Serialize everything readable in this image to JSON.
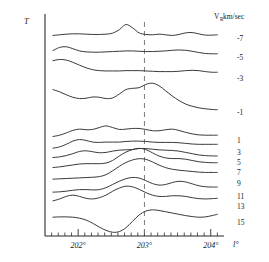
{
  "figure": {
    "y_axis_label": "T",
    "x_axis_label": "l°",
    "legend_header": "V",
    "legend_header_sub": "R",
    "legend_header_unit": " km/sec",
    "marker_line_value": "203°"
  },
  "chart_data": {
    "type": "line",
    "title": "",
    "subtitle": "",
    "xlabel": "l°",
    "ylabel": "T",
    "grid": false,
    "legend_position": "right",
    "legend_title": "V_R km/sec",
    "xlim": [
      201.5,
      204.2
    ],
    "xticks": [
      202,
      203,
      204
    ],
    "xticklabels": [
      "202°",
      "203°",
      "204°"
    ],
    "minor_tick_step": 0.1,
    "annotations": [
      {
        "type": "vline",
        "x": 203,
        "style": "dashed",
        "label": "203°"
      }
    ],
    "note": "Stacked antenna-temperature profiles, one per radial-velocity channel; each trace is offset vertically and labelled at right by its V_R value in km/sec.",
    "series": [
      {
        "name": "-7",
        "label": "-7",
        "baseline_y": 38,
        "x": [
          201.62,
          201.72,
          201.82,
          201.92,
          202.02,
          202.12,
          202.22,
          202.32,
          202.42,
          202.52,
          202.62,
          202.72,
          202.82,
          202.92,
          203.02,
          203.12,
          203.22,
          203.32,
          203.42,
          203.52,
          203.62,
          203.72,
          203.82,
          203.92,
          204.02,
          204.1
        ],
        "values": [
          0.8,
          1.0,
          1.2,
          1.3,
          1.3,
          1.2,
          1.1,
          1.1,
          1.2,
          1.5,
          2.6,
          4.2,
          3.2,
          1.6,
          1.1,
          1.0,
          1.2,
          1.0,
          0.8,
          1.1,
          1.6,
          1.7,
          1.3,
          0.9,
          0.9,
          1.0
        ]
      },
      {
        "name": "-5",
        "label": "-5",
        "baseline_y": 57,
        "x": [
          201.62,
          201.72,
          201.82,
          201.92,
          202.02,
          202.12,
          202.22,
          202.32,
          202.42,
          202.52,
          202.62,
          202.72,
          202.82,
          202.92,
          203.02,
          203.12,
          203.22,
          203.32,
          203.42,
          203.52,
          203.62,
          203.72,
          203.82,
          203.92,
          204.02,
          204.1
        ],
        "values": [
          2.0,
          3.0,
          3.2,
          2.6,
          1.9,
          1.6,
          1.5,
          1.5,
          1.6,
          1.7,
          1.8,
          1.9,
          1.9,
          1.8,
          1.7,
          1.7,
          1.8,
          1.9,
          2.1,
          2.2,
          2.1,
          1.8,
          1.4,
          1.1,
          1.0,
          1.0
        ]
      },
      {
        "name": "-3",
        "label": "-3",
        "baseline_y": 78,
        "x": [
          201.62,
          201.72,
          201.82,
          201.92,
          202.02,
          202.12,
          202.22,
          202.32,
          202.42,
          202.52,
          202.62,
          202.72,
          202.82,
          202.92,
          203.02,
          203.12,
          203.22,
          203.32,
          203.42,
          203.52,
          203.62,
          203.72,
          203.82,
          203.92,
          204.02,
          204.1
        ],
        "values": [
          5.4,
          5.8,
          5.6,
          4.9,
          4.0,
          3.2,
          2.6,
          2.3,
          2.2,
          2.2,
          2.2,
          2.3,
          2.3,
          2.3,
          2.2,
          2.1,
          2.0,
          2.0,
          2.0,
          2.1,
          2.3,
          2.4,
          2.3,
          2.0,
          1.8,
          1.8
        ]
      },
      {
        "name": "-1",
        "label": "-1",
        "baseline_y": 112,
        "x": [
          201.62,
          201.72,
          201.82,
          201.92,
          202.02,
          202.12,
          202.22,
          202.32,
          202.42,
          202.52,
          202.62,
          202.72,
          202.82,
          202.92,
          203.02,
          203.12,
          203.22,
          203.32,
          203.42,
          203.52,
          203.62,
          203.72,
          203.82,
          203.92,
          204.02,
          204.1
        ],
        "values": [
          7.0,
          6.3,
          5.4,
          4.6,
          4.2,
          4.3,
          4.7,
          4.6,
          4.2,
          4.4,
          5.6,
          7.0,
          7.4,
          7.6,
          8.6,
          9.0,
          8.2,
          6.6,
          5.0,
          3.6,
          2.5,
          1.8,
          1.3,
          1.0,
          0.8,
          0.7
        ]
      },
      {
        "name": "1",
        "label": "1",
        "baseline_y": 140,
        "x": [
          201.62,
          201.72,
          201.82,
          201.92,
          202.02,
          202.12,
          202.22,
          202.32,
          202.42,
          202.52,
          202.62,
          202.72,
          202.82,
          202.92,
          203.02,
          203.12,
          203.22,
          203.32,
          203.42,
          203.52,
          203.62,
          203.72,
          203.82,
          203.92,
          204.02,
          204.1
        ],
        "values": [
          1.1,
          1.5,
          2.2,
          3.0,
          3.4,
          3.2,
          3.3,
          3.9,
          4.4,
          3.9,
          3.3,
          3.4,
          3.6,
          3.6,
          3.3,
          2.9,
          2.9,
          3.2,
          3.4,
          3.0,
          2.4,
          1.9,
          1.6,
          1.5,
          1.5,
          1.5
        ]
      },
      {
        "name": "3",
        "label": "3",
        "baseline_y": 152,
        "x": [
          201.62,
          201.72,
          201.82,
          201.92,
          202.02,
          202.12,
          202.22,
          202.32,
          202.42,
          202.52,
          202.62,
          202.72,
          202.82,
          202.92,
          203.02,
          203.12,
          203.22,
          203.32,
          203.42,
          203.52,
          203.62,
          203.72,
          203.82,
          203.92,
          204.02,
          204.1
        ],
        "values": [
          1.2,
          1.6,
          2.4,
          3.4,
          3.9,
          3.6,
          3.1,
          3.0,
          3.1,
          3.1,
          3.1,
          3.3,
          3.4,
          3.4,
          3.3,
          3.1,
          3.0,
          3.0,
          3.0,
          2.9,
          2.7,
          2.5,
          2.4,
          2.4,
          2.4,
          2.4
        ]
      },
      {
        "name": "5",
        "label": "5",
        "baseline_y": 162,
        "x": [
          201.62,
          201.72,
          201.82,
          201.92,
          202.02,
          202.12,
          202.22,
          202.32,
          202.42,
          202.52,
          202.62,
          202.72,
          202.82,
          202.92,
          203.02,
          203.12,
          203.22,
          203.32,
          203.42,
          203.52,
          203.62,
          203.72,
          203.82,
          203.92,
          204.02,
          204.1
        ],
        "values": [
          1.4,
          1.6,
          2.0,
          2.6,
          3.3,
          3.5,
          3.2,
          2.9,
          3.0,
          3.4,
          3.7,
          3.8,
          3.9,
          4.2,
          4.2,
          4.0,
          3.8,
          3.7,
          3.6,
          3.4,
          3.0,
          2.6,
          2.2,
          2.0,
          1.9,
          1.9
        ]
      },
      {
        "name": "7",
        "label": "7",
        "baseline_y": 172,
        "x": [
          201.62,
          201.72,
          201.82,
          201.92,
          202.02,
          202.12,
          202.22,
          202.32,
          202.42,
          202.52,
          202.62,
          202.72,
          202.82,
          202.92,
          203.02,
          203.12,
          203.22,
          203.32,
          203.42,
          203.52,
          203.62,
          203.72,
          203.82,
          203.92,
          204.02,
          204.1
        ],
        "values": [
          1.4,
          1.6,
          1.9,
          2.2,
          2.5,
          2.6,
          2.6,
          2.6,
          2.8,
          3.6,
          5.0,
          6.2,
          7.0,
          7.4,
          7.0,
          6.0,
          5.0,
          4.4,
          4.2,
          4.2,
          4.0,
          3.6,
          3.2,
          3.0,
          2.9,
          2.9
        ]
      },
      {
        "name": "9",
        "label": "9",
        "baseline_y": 183,
        "x": [
          201.62,
          201.72,
          201.82,
          201.92,
          202.02,
          202.12,
          202.22,
          202.32,
          202.42,
          202.52,
          202.62,
          202.72,
          202.82,
          202.92,
          203.02,
          203.12,
          203.22,
          203.32,
          203.42,
          203.52,
          203.62,
          203.72,
          203.82,
          203.92,
          204.02,
          204.1
        ],
        "values": [
          1.2,
          1.3,
          1.4,
          1.5,
          1.6,
          1.7,
          1.8,
          2.0,
          2.6,
          3.8,
          5.2,
          6.4,
          7.2,
          7.6,
          7.4,
          6.6,
          5.6,
          4.8,
          4.3,
          4.0,
          3.8,
          3.6,
          3.4,
          3.3,
          3.3,
          3.3
        ]
      },
      {
        "name": "11",
        "label": "11",
        "baseline_y": 196,
        "x": [
          201.62,
          201.72,
          201.82,
          201.92,
          202.02,
          202.12,
          202.22,
          202.32,
          202.42,
          202.52,
          202.62,
          202.72,
          202.82,
          202.92,
          203.02,
          203.12,
          203.22,
          203.32,
          203.42,
          203.52,
          203.62,
          203.72,
          203.82,
          203.92,
          204.02,
          204.1
        ],
        "values": [
          1.2,
          1.3,
          1.5,
          1.8,
          2.0,
          2.0,
          1.9,
          2.0,
          2.6,
          3.6,
          4.6,
          5.4,
          5.8,
          5.6,
          4.8,
          3.9,
          3.4,
          3.6,
          4.2,
          4.6,
          4.4,
          3.8,
          3.2,
          2.9,
          2.8,
          2.8
        ]
      },
      {
        "name": "13",
        "label": "13",
        "baseline_y": 206,
        "x": [
          201.62,
          201.72,
          201.82,
          201.92,
          202.02,
          202.12,
          202.22,
          202.32,
          202.42,
          202.52,
          202.62,
          202.72,
          202.82,
          202.92,
          203.02,
          203.12,
          203.22,
          203.32,
          203.42,
          203.52,
          203.62,
          203.72,
          203.82,
          203.92,
          204.02,
          204.1
        ],
        "values": [
          1.6,
          2.2,
          3.0,
          3.4,
          3.0,
          2.4,
          2.2,
          2.6,
          3.4,
          4.6,
          5.6,
          6.2,
          6.0,
          5.2,
          4.2,
          3.4,
          3.0,
          3.0,
          3.2,
          3.2,
          3.0,
          2.6,
          2.3,
          2.2,
          2.3,
          2.4
        ]
      },
      {
        "name": "15",
        "label": "15",
        "baseline_y": 222,
        "x": [
          201.62,
          201.72,
          201.82,
          201.92,
          202.02,
          202.12,
          202.22,
          202.32,
          202.42,
          202.52,
          202.62,
          202.72,
          202.82,
          202.92,
          203.02,
          203.12,
          203.22,
          203.32,
          203.42,
          203.52,
          203.62,
          203.72,
          203.82,
          203.92,
          204.02,
          204.1
        ],
        "values": [
          1.5,
          1.6,
          1.6,
          1.5,
          1.2,
          0.6,
          -0.4,
          -1.6,
          -2.6,
          -3.2,
          -3.0,
          -1.8,
          0.2,
          2.2,
          3.4,
          3.8,
          3.6,
          3.2,
          2.8,
          2.4,
          2.0,
          1.7,
          1.5,
          1.6,
          2.0,
          2.4
        ]
      }
    ]
  },
  "axes": {
    "x_major_ticks": [
      {
        "value": 202,
        "label": "202°"
      },
      {
        "value": 203,
        "label": "203°"
      },
      {
        "value": 204,
        "label": "204°"
      }
    ],
    "y_axis_title": "T",
    "x_axis_title": "l°"
  }
}
